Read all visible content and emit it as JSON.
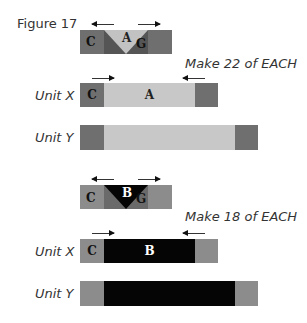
{
  "figure": {
    "title": "Figure 17",
    "sections": [
      {
        "block": {
          "left_letter": "C",
          "center_letter": "A",
          "right_letter": "G",
          "outer_color": "#6f6f6f",
          "wing_color": "#555555",
          "center_color": "#c2c2c2",
          "center_text_color": "#222222"
        },
        "instruction": "Make 22 of EACH",
        "unit_x": {
          "label": "Unit X",
          "left_letter": "C",
          "center_letter": "A",
          "end_color": "#6f6f6f",
          "center_color": "#c8c8c8",
          "center_text_color": "#222222"
        },
        "unit_y": {
          "label": "Unit Y",
          "end_color": "#6f6f6f",
          "center_color": "#c8c8c8"
        }
      },
      {
        "block": {
          "left_letter": "C",
          "center_letter": "B",
          "right_letter": "G",
          "outer_color": "#8c8c8c",
          "wing_color": "#6a6a6a",
          "center_color": "#050505",
          "center_text_color": "#ffffff"
        },
        "instruction": "Make 18 of EACH",
        "unit_x": {
          "label": "Unit X",
          "left_letter": "C",
          "center_letter": "B",
          "end_color": "#8c8c8c",
          "center_color": "#050505",
          "center_text_color": "#ffffff"
        },
        "unit_y": {
          "label": "Unit Y",
          "end_color": "#8c8c8c",
          "center_color": "#050505"
        }
      }
    ]
  }
}
